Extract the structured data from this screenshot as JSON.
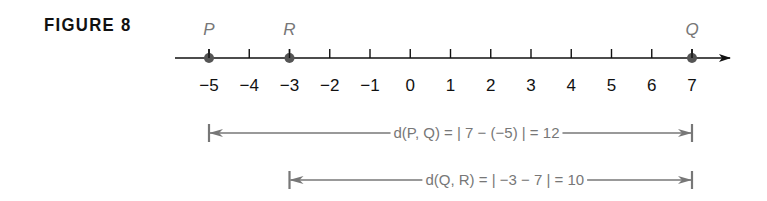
{
  "figure": {
    "title": "FIGURE 8"
  },
  "number_line": {
    "min": -5,
    "max": 7,
    "ticks": [
      "−5",
      "−4",
      "−3",
      "−2",
      "−1",
      "0",
      "1",
      "2",
      "3",
      "4",
      "5",
      "6",
      "7"
    ],
    "points": [
      {
        "label": "P",
        "value": -5
      },
      {
        "label": "R",
        "value": -3
      },
      {
        "label": "Q",
        "value": 7
      }
    ]
  },
  "distances": [
    {
      "from": -5,
      "to": 7,
      "text": "d(P, Q) = | 7 − (−5) | = 12"
    },
    {
      "from": -3,
      "to": 7,
      "text": "d(Q, R) = | −3 − 7 | = 10"
    }
  ],
  "colors": {
    "line": "#111111",
    "point": "#555555",
    "label_gray": "#777777"
  }
}
